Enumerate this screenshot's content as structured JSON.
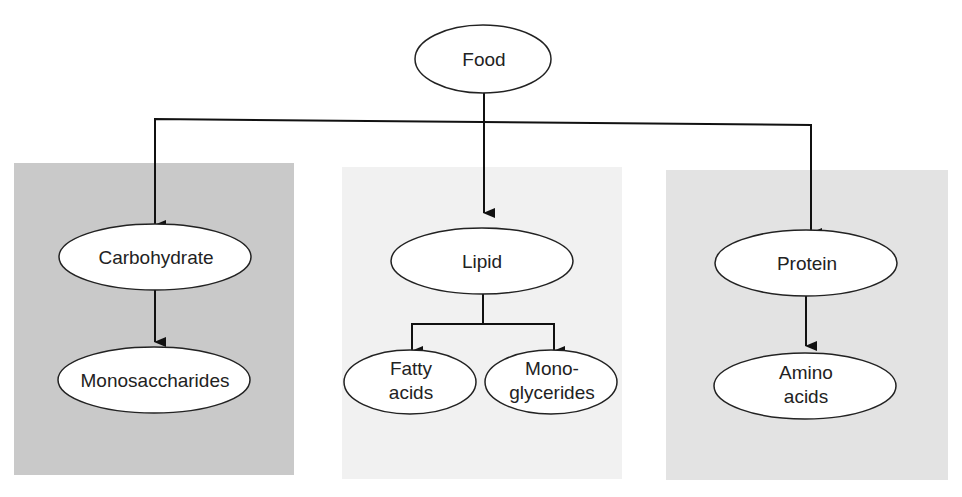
{
  "diagram": {
    "root": {
      "label": "Food"
    },
    "panels": [
      {
        "name": "carbohydrate",
        "color": "#c9c9c9",
        "node": "Carbohydrate",
        "children": [
          "Monosaccharides"
        ]
      },
      {
        "name": "lipid",
        "color": "#f1f1f1",
        "node": "Lipid",
        "children": [
          [
            "Fatty",
            "acids"
          ],
          [
            "Mono-",
            "glycerides"
          ]
        ]
      },
      {
        "name": "protein",
        "color": "#e3e3e3",
        "node": "Protein",
        "children": [
          [
            "Amino",
            "acids"
          ]
        ]
      }
    ]
  }
}
